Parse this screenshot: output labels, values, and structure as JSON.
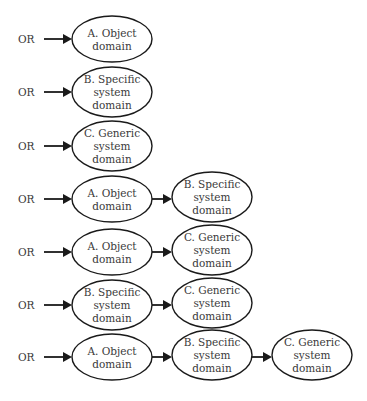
{
  "diagram": {
    "or_label": "OR",
    "nodes": {
      "A": [
        "A. Object",
        "domain"
      ],
      "B": [
        "B. Specific",
        "system",
        "domain"
      ],
      "C": [
        "C. Generic",
        "system",
        "domain"
      ]
    },
    "rows": [
      {
        "or": "OR",
        "chain": [
          "A"
        ]
      },
      {
        "or": "OR",
        "chain": [
          "B"
        ]
      },
      {
        "or": "OR",
        "chain": [
          "C"
        ]
      },
      {
        "or": "OR",
        "chain": [
          "A",
          "B"
        ]
      },
      {
        "or": "OR",
        "chain": [
          "A",
          "C"
        ]
      },
      {
        "or": "OR",
        "chain": [
          "B",
          "C"
        ]
      },
      {
        "or": "OR",
        "chain": [
          "A",
          "B",
          "C"
        ]
      }
    ]
  },
  "layout": {
    "row_y": [
      39,
      92,
      146,
      199,
      252,
      305,
      357
    ],
    "col_x": [
      112,
      212,
      312
    ],
    "rx": 40,
    "ry_two": 23,
    "ry_three": 25,
    "or_x": 18,
    "arrow_start_x": 44
  }
}
